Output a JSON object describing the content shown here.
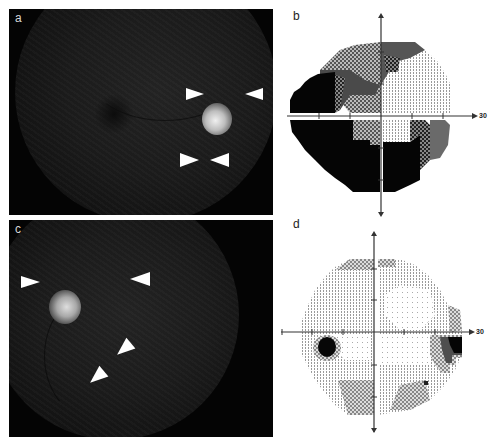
{
  "figure": {
    "panels": [
      {
        "id": "a",
        "label": "a",
        "type": "fundus-photograph",
        "arrowheads": 4,
        "eye": "right"
      },
      {
        "id": "b",
        "label": "b",
        "type": "visual-field-grayscale",
        "axis_label": "30"
      },
      {
        "id": "c",
        "label": "c",
        "type": "fundus-photograph",
        "arrowheads": 4,
        "eye": "left"
      },
      {
        "id": "d",
        "label": "d",
        "type": "visual-field-grayscale",
        "axis_label": "30"
      }
    ]
  },
  "colors": {
    "background": "#ffffff",
    "fundus_bg": "#040404",
    "disc": "#e6e6e6",
    "arrowhead": "#ffffff",
    "vf_black": "#050505",
    "vf_dark": "#3a3a3a",
    "vf_mid": "#7a7a7a",
    "vf_light": "#c8c8c8",
    "vf_dots": "#9a9a9a"
  }
}
